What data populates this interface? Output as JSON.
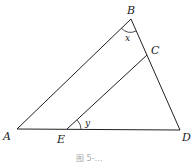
{
  "diagram": {
    "points": {
      "A": {
        "label": "A",
        "x": 17,
        "y": 129
      },
      "B": {
        "label": "B",
        "x": 131,
        "y": 19
      },
      "C": {
        "label": "C",
        "x": 147,
        "y": 55
      },
      "D": {
        "label": "D",
        "x": 180,
        "y": 130
      },
      "E": {
        "label": "E",
        "x": 67,
        "y": 129
      }
    },
    "segments": [
      "AB",
      "BD",
      "AD",
      "EC"
    ],
    "angles": {
      "x": {
        "label": "x",
        "vertex": "B"
      },
      "y": {
        "label": "y",
        "vertex": "E"
      }
    },
    "caption": "图 5-…"
  }
}
